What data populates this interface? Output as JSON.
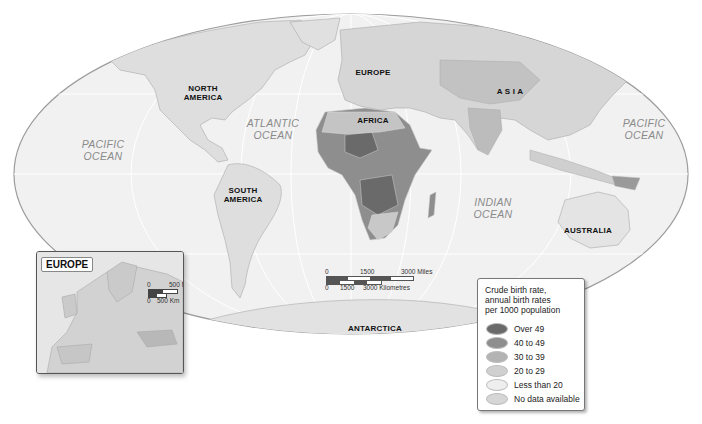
{
  "map": {
    "projection": "world-ellipse",
    "colors": {
      "ocean": "#f1f1f1",
      "land": "#dcdcdc",
      "border": "#9a9a9a",
      "over_49": "#6a6a6a",
      "40_to_49": "#8e8e8e",
      "30_to_39": "#b3b3b3",
      "20_to_29": "#d0d0d0",
      "less_than_20": "#e8e8e8",
      "no_data": "#d8d8d8"
    },
    "continents": [
      {
        "id": "north-america",
        "line1": "NORTH",
        "line2": "AMERICA"
      },
      {
        "id": "south-america",
        "line1": "SOUTH",
        "line2": "AMERICA"
      },
      {
        "id": "europe",
        "line1": "EUROPE",
        "line2": ""
      },
      {
        "id": "africa",
        "line1": "AFRICA",
        "line2": ""
      },
      {
        "id": "asia",
        "line1": "A S I A",
        "line2": ""
      },
      {
        "id": "australia",
        "line1": "AUSTRALIA",
        "line2": ""
      },
      {
        "id": "antarctica",
        "line1": "ANTARCTICA",
        "line2": ""
      }
    ],
    "oceans": [
      {
        "id": "pacific-west",
        "line1": "PACIFIC",
        "line2": "OCEAN"
      },
      {
        "id": "atlantic",
        "line1": "ATLANTIC",
        "line2": "OCEAN"
      },
      {
        "id": "indian",
        "line1": "INDIAN",
        "line2": "OCEAN"
      },
      {
        "id": "pacific-east",
        "line1": "PACIFIC",
        "line2": "OCEAN"
      }
    ]
  },
  "scale_bar": {
    "miles": {
      "zero": "0",
      "mid": "1500",
      "max": "3000 Miles"
    },
    "km": {
      "zero": "0",
      "mid": "1500",
      "max": "3000 Kilometres"
    }
  },
  "inset": {
    "title": "EUROPE",
    "scale": {
      "miles_zero": "0",
      "miles_max": "500 Mi",
      "km_zero": "0",
      "km_max": "500 Km"
    }
  },
  "legend": {
    "title_line1": "Crude birth rate,",
    "title_line2": "annual birth rates",
    "title_line3": "per 1000 population",
    "items": [
      {
        "label": "Over 49",
        "color": "#6a6a6a"
      },
      {
        "label": "40 to 49",
        "color": "#8e8e8e"
      },
      {
        "label": "30 to 39",
        "color": "#b3b3b3"
      },
      {
        "label": "20 to 29",
        "color": "#d0d0d0"
      },
      {
        "label": "Less than 20",
        "color": "#eeeeee"
      },
      {
        "label": "No data available",
        "color": "#d6d6d6"
      }
    ]
  }
}
